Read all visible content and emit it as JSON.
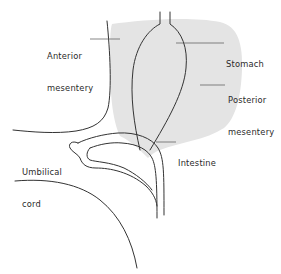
{
  "diagram": {
    "type": "anatomical-illustration",
    "colors": {
      "line": "#333333",
      "shade": "#e4e4e4",
      "background": "#ffffff",
      "text": "#2a2a2a"
    },
    "labels": {
      "anterior_mesentery_line1": "Anterior",
      "anterior_mesentery_line2": "mesentery",
      "stomach": "Stomach",
      "posterior_mesentery_line1": "Posterior",
      "posterior_mesentery_line2": "mesentery",
      "intestine": "Intestine",
      "umbilical_cord_line1": "Umbilical",
      "umbilical_cord_line2": "cord"
    }
  }
}
